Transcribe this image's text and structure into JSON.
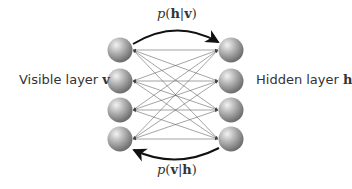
{
  "diagram": {
    "visible_layer": {
      "label": "Visible layer",
      "symbol": "v",
      "node_count": 4
    },
    "hidden_layer": {
      "label": "Hidden layer",
      "symbol": "h",
      "node_count": 4
    },
    "top_arrow": {
      "prefix": "p(",
      "a": "h",
      "sep": "|",
      "b": "v",
      "suffix": ")",
      "direction": "visible-to-hidden"
    },
    "bottom_arrow": {
      "prefix": "p(",
      "a": "v",
      "sep": "|",
      "b": "h",
      "suffix": ")",
      "direction": "hidden-to-visible"
    },
    "connections": "fully connected, bidirectional",
    "colors": {
      "node": "#9a9a9a",
      "edge": "#555555",
      "arrow": "#111111",
      "text": "#333333"
    }
  }
}
